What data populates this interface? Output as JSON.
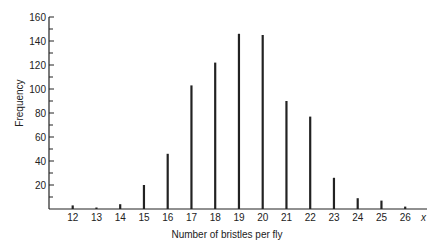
{
  "chart_data": {
    "type": "bar",
    "title": "",
    "xlabel": "Number of bristles per fly",
    "ylabel": "Frequency",
    "x_axis_symbol": "x",
    "categories": [
      "12",
      "13",
      "14",
      "15",
      "16",
      "17",
      "18",
      "19",
      "20",
      "21",
      "22",
      "23",
      "24",
      "25",
      "26"
    ],
    "values": [
      3,
      1,
      4,
      20,
      46,
      103,
      122,
      146,
      145,
      90,
      77,
      26,
      9,
      7,
      2
    ],
    "ylim": [
      0,
      160
    ],
    "yticks": [
      20,
      40,
      60,
      80,
      100,
      120,
      140,
      160
    ],
    "minor_ytick_step": 10,
    "grid": false,
    "legend": null,
    "bar_color": "#222222"
  }
}
